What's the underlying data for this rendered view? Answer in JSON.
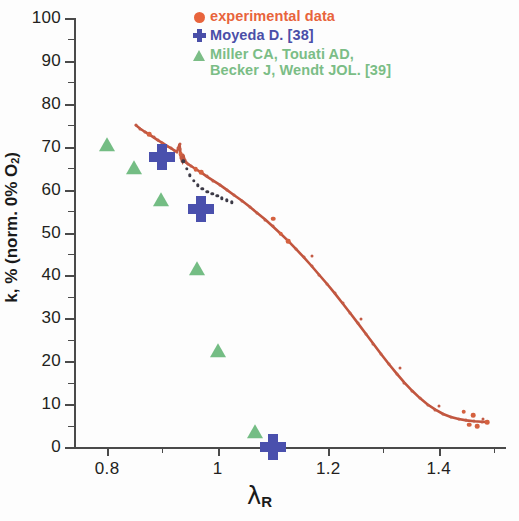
{
  "chart_data": {
    "type": "scatter",
    "title": "",
    "xlabel": "λ_R",
    "ylabel": "k, % (norm. 0% O2)",
    "xlim": [
      0.74,
      1.52
    ],
    "ylim": [
      0,
      100
    ],
    "grid": false,
    "legend_position": "top-right",
    "x_ticks": [
      "0.8",
      "1",
      "1.2",
      "1.4"
    ],
    "x_tick_values": [
      0.8,
      1.0,
      1.2,
      1.4
    ],
    "x_minor_tick_values": [
      0.9,
      1.1,
      1.3,
      1.5
    ],
    "y_ticks": [
      "0",
      "10",
      "20",
      "30",
      "40",
      "50",
      "60",
      "70",
      "80",
      "90",
      "100"
    ],
    "y_tick_values": [
      0,
      10,
      20,
      30,
      40,
      50,
      60,
      70,
      80,
      90,
      100
    ],
    "y_minor_tick_values": [
      5,
      15,
      25,
      35,
      45,
      55,
      65,
      75,
      85,
      95
    ],
    "series": [
      {
        "name": "experimental data",
        "marker": "circle",
        "color": "#e8643c",
        "points": [
          [
            0.852,
            75.0
          ],
          [
            0.86,
            74.2
          ],
          [
            0.868,
            73.5
          ],
          [
            0.876,
            72.9
          ],
          [
            0.884,
            72.2
          ],
          [
            0.892,
            71.5
          ],
          [
            0.9,
            70.9
          ],
          [
            0.908,
            70.2
          ],
          [
            0.916,
            69.6
          ],
          [
            0.922,
            69.1
          ],
          [
            0.926,
            68.8
          ],
          [
            0.929,
            69.6
          ],
          [
            0.931,
            70.6
          ],
          [
            0.932,
            69.4
          ],
          [
            0.933,
            68.2
          ],
          [
            0.934,
            67.3
          ],
          [
            0.936,
            66.7
          ],
          [
            0.938,
            68.0
          ],
          [
            0.94,
            67.0
          ],
          [
            0.942,
            66.4
          ],
          [
            0.946,
            66.0
          ],
          [
            0.952,
            65.5
          ],
          [
            0.96,
            64.8
          ],
          [
            0.97,
            64.0
          ],
          [
            0.98,
            63.1
          ],
          [
            0.992,
            62.1
          ],
          [
            1.004,
            61.1
          ],
          [
            1.016,
            60.0
          ],
          [
            1.03,
            58.7
          ],
          [
            1.044,
            57.4
          ],
          [
            1.058,
            56.0
          ],
          [
            1.072,
            54.5
          ],
          [
            1.086,
            53.0
          ],
          [
            1.1,
            51.4
          ],
          [
            1.114,
            49.7
          ],
          [
            1.128,
            48.0
          ],
          [
            1.142,
            46.1
          ],
          [
            1.156,
            44.2
          ],
          [
            1.17,
            42.2
          ],
          [
            1.184,
            40.1
          ],
          [
            1.198,
            38.0
          ],
          [
            1.212,
            35.8
          ],
          [
            1.226,
            33.5
          ],
          [
            1.24,
            31.2
          ],
          [
            1.254,
            28.8
          ],
          [
            1.268,
            26.4
          ],
          [
            1.282,
            24.0
          ],
          [
            1.296,
            21.6
          ],
          [
            1.31,
            19.3
          ],
          [
            1.324,
            17.1
          ],
          [
            1.338,
            15.0
          ],
          [
            1.352,
            13.1
          ],
          [
            1.366,
            11.4
          ],
          [
            1.38,
            9.9
          ],
          [
            1.394,
            8.7
          ],
          [
            1.408,
            7.7
          ],
          [
            1.422,
            7.0
          ],
          [
            1.436,
            6.5
          ],
          [
            1.45,
            6.2
          ],
          [
            1.464,
            6.0
          ],
          [
            1.478,
            5.9
          ],
          [
            1.488,
            5.8
          ]
        ],
        "outlier_points": [
          [
            1.1,
            53.2
          ],
          [
            1.17,
            44.6
          ],
          [
            1.26,
            29.8
          ],
          [
            1.33,
            18.3
          ],
          [
            1.4,
            9.6
          ],
          [
            1.445,
            8.2
          ],
          [
            1.462,
            7.4
          ],
          [
            1.455,
            5.2
          ],
          [
            1.47,
            4.9
          ],
          [
            1.48,
            6.6
          ]
        ],
        "fit_line": true
      },
      {
        "name": "secondary branch",
        "marker": "small-dot",
        "color": "#3c3a46",
        "points": [
          [
            0.938,
            66.6
          ],
          [
            0.944,
            64.9
          ],
          [
            0.95,
            63.3
          ],
          [
            0.957,
            62.0
          ],
          [
            0.964,
            61.0
          ],
          [
            0.972,
            60.2
          ],
          [
            0.981,
            59.5
          ],
          [
            0.99,
            59.0
          ],
          [
            0.999,
            58.5
          ],
          [
            1.008,
            58.0
          ],
          [
            1.017,
            57.5
          ],
          [
            1.026,
            57.0
          ]
        ]
      },
      {
        "name": "Moyeda D. [38]",
        "marker": "plus",
        "color": "#4a50ad",
        "points": [
          [
            0.9,
            67.5
          ],
          [
            0.97,
            55.5
          ],
          [
            1.1,
            0.0
          ]
        ]
      },
      {
        "name": "Miller CA, Touati AD, Becker J, Wendt JOL. [39]",
        "marker": "triangle",
        "color": "#74bd84",
        "points": [
          [
            0.8,
            70.0
          ],
          [
            0.848,
            64.5
          ],
          [
            0.898,
            57.0
          ],
          [
            0.962,
            41.0
          ],
          [
            1.0,
            22.0
          ],
          [
            1.068,
            3.0
          ]
        ]
      }
    ]
  },
  "axes": {
    "y_title_main": "k",
    "y_title_rest": ", % (norm. 0% O",
    "y_title_sub": "2",
    "y_title_close": ")",
    "x_title_symbol": "λ",
    "x_title_sub": "R"
  },
  "legend": {
    "items": [
      {
        "icon": "filled-circle-marker",
        "label": "experimental data",
        "color": "#e8643c"
      },
      {
        "icon": "plus-cross-marker",
        "label": "Moyeda D. [38]",
        "color": "#4a4fa8"
      },
      {
        "icon": "filled-triangle-marker",
        "label_line1": "Miller CA, Touati AD,",
        "label_line2": "Becker J, Wendt JOL. [39]",
        "color": "#7bbd86"
      }
    ]
  }
}
